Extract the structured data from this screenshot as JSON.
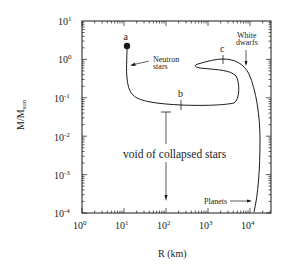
{
  "chart_data": {
    "type": "line",
    "title": "",
    "xlabel": "R (km)",
    "ylabel": "M/M_sun",
    "ylabel_main": "M/M",
    "ylabel_sub": "sun",
    "xscale": "log",
    "yscale": "log",
    "xlim": [
      1,
      31623
    ],
    "ylim": [
      0.0001,
      10
    ],
    "grid": false,
    "legend": null,
    "x_ticks": [
      {
        "base": "10",
        "exp": "0",
        "value": 1
      },
      {
        "base": "10",
        "exp": "1",
        "value": 10
      },
      {
        "base": "10",
        "exp": "2",
        "value": 100
      },
      {
        "base": "10",
        "exp": "3",
        "value": 1000
      },
      {
        "base": "10",
        "exp": "4",
        "value": 10000
      }
    ],
    "y_ticks": [
      {
        "base": "10",
        "exp": "1",
        "value": 10
      },
      {
        "base": "10",
        "exp": "0",
        "value": 1
      },
      {
        "base": "10",
        "exp": "-1",
        "value": 0.1
      },
      {
        "base": "10",
        "exp": "-2",
        "value": 0.01
      },
      {
        "base": "10",
        "exp": "-3",
        "value": 0.001
      },
      {
        "base": "10",
        "exp": "-4",
        "value": 0.0001
      }
    ],
    "series": [
      {
        "name": "Mass-radius relation of cold matter",
        "points_R_km_M_msun": [
          [
            12,
            2.2
          ],
          [
            12,
            1.2
          ],
          [
            12.5,
            0.6
          ],
          [
            13,
            0.3
          ],
          [
            15,
            0.13
          ],
          [
            22,
            0.085
          ],
          [
            60,
            0.068
          ],
          [
            230,
            0.063
          ],
          [
            1500,
            0.064
          ],
          [
            7000,
            0.07
          ],
          [
            7500,
            0.2
          ],
          [
            6000,
            0.45
          ],
          [
            2500,
            0.58
          ],
          [
            700,
            0.65
          ],
          [
            1200,
            0.82
          ],
          [
            2300,
            0.95
          ],
          [
            5000,
            0.82
          ],
          [
            9000,
            0.35
          ],
          [
            13000,
            0.06
          ],
          [
            16000,
            0.006
          ],
          [
            15000,
            0.0008
          ],
          [
            13000,
            0.00012
          ]
        ]
      }
    ],
    "annotations": [
      {
        "text": "a",
        "R_km": 12,
        "M_msun": 2.2,
        "marker": "filled-circle",
        "meaning": "maximum neutron star mass"
      },
      {
        "text": "b",
        "R_km": 230,
        "M_msun": 0.063,
        "meaning": "minimum neutron star mass"
      },
      {
        "text": "c",
        "R_km": 2300,
        "M_msun": 0.95,
        "meaning": "maximum white dwarf mass"
      },
      {
        "text": "Neutron stars",
        "arrow_to": "neutron star branch"
      },
      {
        "text": "White dwarfs",
        "arrow_to": "white dwarf branch"
      },
      {
        "text": "Planets",
        "arrow_to": "planet branch"
      },
      {
        "text": "void of collapsed stars",
        "range_marker": "vertical bar at R≈100 km from M≈0.05 down to M≈0.0002"
      }
    ]
  },
  "labels": {
    "a": "a",
    "b": "b",
    "c": "c",
    "neutron_line1": "Neutron",
    "neutron_line2": "stars",
    "white_line1": "White",
    "white_line2": "dwarfs",
    "planets": "Planets",
    "void": "void of collapsed stars",
    "xlabel": "R (km)",
    "ylabel_main": "M/M",
    "ylabel_sub": "sun",
    "x_ticks": [
      {
        "base": "10",
        "exp": "0"
      },
      {
        "base": "10",
        "exp": "1"
      },
      {
        "base": "10",
        "exp": "2"
      },
      {
        "base": "10",
        "exp": "3"
      },
      {
        "base": "10",
        "exp": "4"
      }
    ],
    "y_ticks": [
      {
        "base": "10",
        "exp": "1"
      },
      {
        "base": "10",
        "exp": "0"
      },
      {
        "base": "10",
        "exp": "-1"
      },
      {
        "base": "10",
        "exp": "-2"
      },
      {
        "base": "10",
        "exp": "-3"
      },
      {
        "base": "10",
        "exp": "-4"
      }
    ]
  },
  "colors": {
    "ink": "#1a1a1a",
    "background": "#ffffff"
  }
}
